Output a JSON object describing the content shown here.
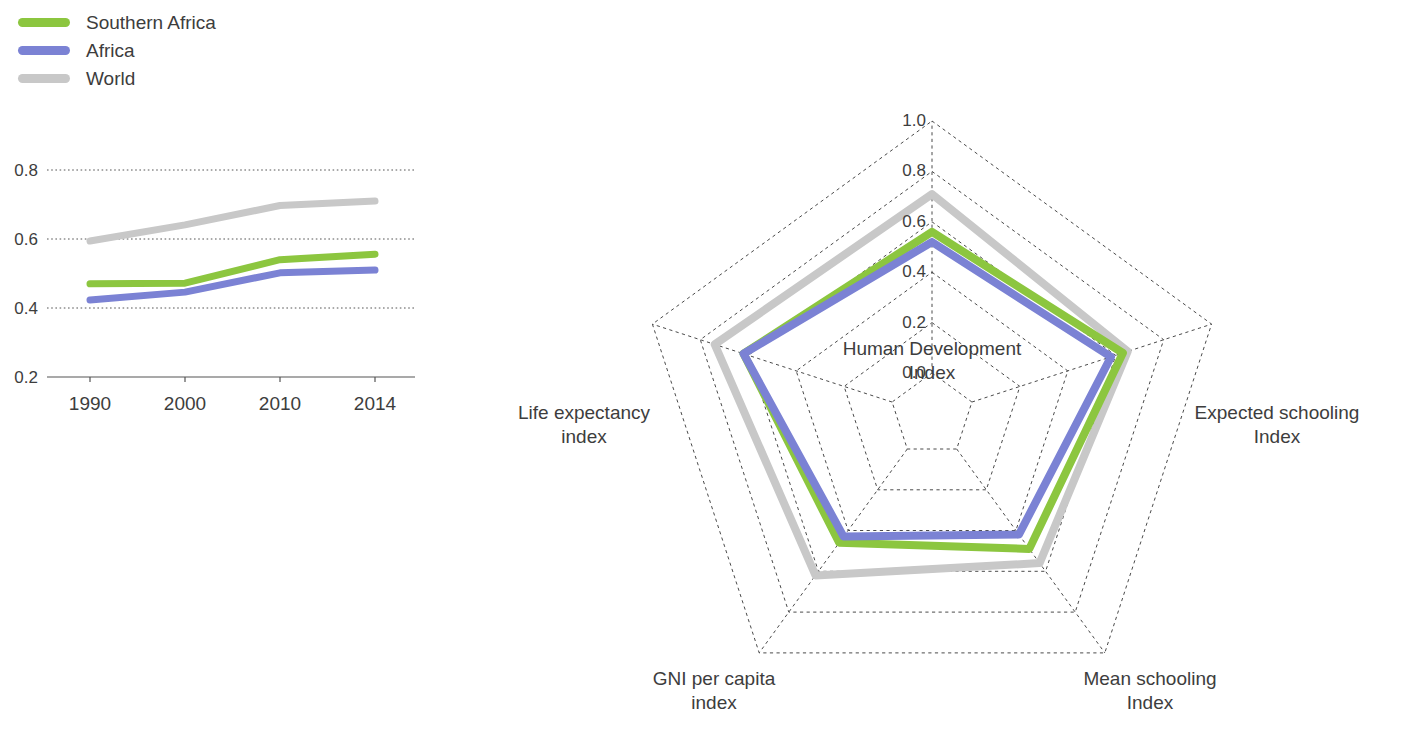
{
  "legend": {
    "items": [
      {
        "label": "Southern Africa",
        "color": "#8cc63f"
      },
      {
        "label": "Africa",
        "color": "#7b82d4"
      },
      {
        "label": "World",
        "color": "#c8c8c8"
      }
    ]
  },
  "chart_data": [
    {
      "id": "line",
      "type": "line",
      "title": "",
      "xlabel": "",
      "ylabel": "",
      "grid": true,
      "legend_position": "top-left",
      "categories": [
        "1990",
        "2000",
        "2010",
        "2014"
      ],
      "x_tick_labels": [
        "1990",
        "2000",
        "2010",
        "2014"
      ],
      "y_tick_labels": [
        "0.2",
        "0.4",
        "0.6",
        "0.8"
      ],
      "ylim": [
        0.2,
        0.8
      ],
      "yticks": [
        0.2,
        0.4,
        0.6,
        0.8
      ],
      "series": [
        {
          "name": "Southern Africa",
          "color": "#8cc63f",
          "values": [
            0.47,
            0.472,
            0.54,
            0.556
          ]
        },
        {
          "name": "Africa",
          "color": "#7b82d4",
          "values": [
            0.423,
            0.446,
            0.502,
            0.51
          ]
        },
        {
          "name": "World",
          "color": "#c8c8c8",
          "values": [
            0.594,
            0.641,
            0.697,
            0.71
          ]
        }
      ]
    },
    {
      "id": "radar",
      "type": "radar",
      "title": "",
      "grid": true,
      "legend_position": "top-left",
      "rlim": [
        0.0,
        1.0
      ],
      "rticks": [
        0.0,
        0.2,
        0.4,
        0.6,
        0.8,
        1.0
      ],
      "r_tick_labels": [
        "0.0",
        "0.2",
        "0.4",
        "0.6",
        "0.8",
        "1.0"
      ],
      "categories": [
        "Human Development\nIndex",
        "Expected schooling\nIndex",
        "Mean schooling\nIndex",
        "GNI per capita\nindex",
        "Life expectancy\nindex"
      ],
      "series": [
        {
          "name": "Southern Africa",
          "color": "#8cc63f",
          "values": [
            0.56,
            0.63,
            0.49,
            0.46,
            0.62
          ]
        },
        {
          "name": "Africa",
          "color": "#7b82d4",
          "values": [
            0.52,
            0.58,
            0.42,
            0.43,
            0.62
          ]
        },
        {
          "name": "World",
          "color": "#c8c8c8",
          "values": [
            0.71,
            0.65,
            0.56,
            0.62,
            0.74
          ]
        }
      ]
    }
  ]
}
